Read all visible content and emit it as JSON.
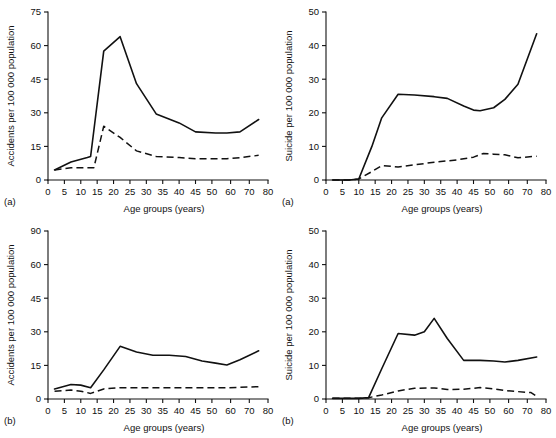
{
  "figure": {
    "background": "#ffffff",
    "ink_color": "#111111",
    "panel_count": 4
  },
  "panels": [
    {
      "id": "top-left",
      "letter": "(a)",
      "ylabel": "Accidents per 100 000 population",
      "xlabel": "Age groups (years)",
      "yticks": [
        "0",
        "15",
        "30",
        "45",
        "60",
        "75"
      ],
      "xticks": [
        "0",
        "5",
        "10",
        "15",
        "20",
        "25",
        "30",
        "35",
        "40",
        "45",
        "50",
        "60",
        "70",
        "80"
      ]
    },
    {
      "id": "top-right",
      "letter": "(a)",
      "ylabel": "Suicide per 100 000 population",
      "xlabel": "Age groups (years)",
      "yticks": [
        "0",
        "10",
        "20",
        "30",
        "40",
        "50"
      ],
      "xticks": [
        "0",
        "5",
        "10",
        "15",
        "20",
        "25",
        "30",
        "35",
        "40",
        "45",
        "50",
        "60",
        "70",
        "80"
      ]
    },
    {
      "id": "bottom-left",
      "letter": "(b)",
      "ylabel": "Accidents per 100 000 population",
      "xlabel": "Age groups (years)",
      "yticks": [
        "0",
        "15",
        "30",
        "45",
        "60",
        "90"
      ],
      "xticks": [
        "0",
        "5",
        "10",
        "15",
        "20",
        "25",
        "30",
        "35",
        "40",
        "45",
        "50",
        "60",
        "70",
        "80"
      ]
    },
    {
      "id": "bottom-right",
      "letter": "(b)",
      "ylabel": "Suicide per 100 000 population",
      "xlabel": "Age groups (years)",
      "yticks": [
        "0",
        "10",
        "20",
        "30",
        "40",
        "50"
      ],
      "xticks": [
        "0",
        "5",
        "10",
        "15",
        "20",
        "25",
        "30",
        "35",
        "40",
        "45",
        "50",
        "60",
        "70",
        "80"
      ]
    }
  ],
  "chart_data": [
    {
      "type": "line",
      "panel": "top-left",
      "panel_letter": "(a)",
      "title": "",
      "xlabel": "Age groups (years)",
      "ylabel": "Accidents per 100 000 population",
      "xlim": [
        0,
        80
      ],
      "ylim": [
        0,
        75
      ],
      "ytick_values": [
        0,
        15,
        30,
        45,
        60,
        75
      ],
      "xtick_values": [
        0,
        5,
        10,
        15,
        20,
        25,
        30,
        35,
        40,
        45,
        50,
        60,
        70,
        80
      ],
      "x_axis_note": "linear spacing 0-50, compressed spacing for 50-60-70-80",
      "grid": false,
      "legend": "none",
      "series": [
        {
          "name": "solid-line",
          "style": "solid",
          "x": [
            2,
            7,
            12,
            13,
            17,
            22,
            27,
            33,
            40,
            45,
            52,
            58,
            65,
            75
          ],
          "values": [
            4.5,
            8.0,
            10.0,
            10.5,
            57.5,
            64.0,
            43.0,
            29.5,
            25.5,
            21.5,
            21.0,
            21.0,
            21.5,
            27.0
          ]
        },
        {
          "name": "dashed-line",
          "style": "dashed",
          "x": [
            2,
            7,
            12,
            14,
            17,
            22,
            27,
            33,
            40,
            45,
            52,
            58,
            65,
            75
          ],
          "values": [
            4.5,
            5.5,
            5.5,
            5.5,
            24.0,
            19.0,
            13.0,
            10.5,
            10.0,
            9.5,
            9.5,
            9.5,
            10.0,
            11.0
          ]
        }
      ]
    },
    {
      "type": "line",
      "panel": "top-right",
      "panel_letter": "(a)",
      "title": "",
      "xlabel": "Age groups (years)",
      "ylabel": "Suicide per 100 000 population",
      "xlim": [
        0,
        80
      ],
      "ylim": [
        0,
        50
      ],
      "ytick_values": [
        0,
        10,
        20,
        30,
        40,
        50
      ],
      "xtick_values": [
        0,
        5,
        10,
        15,
        20,
        25,
        30,
        35,
        40,
        45,
        50,
        60,
        70,
        80
      ],
      "x_axis_note": "linear spacing 0-50, compressed spacing for 50-60-70-80",
      "grid": false,
      "legend": "none",
      "series": [
        {
          "name": "solid-line",
          "style": "solid",
          "x": [
            2,
            7,
            10,
            14,
            17,
            22,
            27,
            33,
            37,
            42,
            45,
            47,
            52,
            58,
            65,
            75
          ],
          "values": [
            0.0,
            0.0,
            0.3,
            10.0,
            18.5,
            25.5,
            25.3,
            24.8,
            24.3,
            22.0,
            20.8,
            20.6,
            21.5,
            24.0,
            28.5,
            43.5
          ]
        },
        {
          "name": "dashed-line",
          "style": "dashed",
          "x": [
            2,
            7,
            10,
            14,
            17,
            22,
            27,
            33,
            40,
            45,
            48,
            52,
            58,
            65,
            75
          ],
          "values": [
            0.0,
            0.0,
            0.3,
            2.5,
            4.3,
            3.9,
            4.5,
            5.3,
            6.0,
            6.8,
            7.9,
            7.7,
            7.5,
            6.6,
            7.1
          ]
        }
      ]
    },
    {
      "type": "line",
      "panel": "bottom-left",
      "panel_letter": "(b)",
      "title": "",
      "xlabel": "Age groups (years)",
      "ylabel": "Accidents per 100 000 population",
      "xlim": [
        0,
        80
      ],
      "ylim": [
        0,
        90
      ],
      "ytick_values": [
        0,
        15,
        30,
        45,
        60,
        90
      ],
      "ytick_note": "top tick printed as 90; tick spacing on plate is uniform",
      "xtick_values": [
        0,
        5,
        10,
        15,
        20,
        25,
        30,
        35,
        40,
        45,
        50,
        60,
        70,
        80
      ],
      "x_axis_note": "linear spacing 0-50, compressed spacing for 50-60-70-80",
      "grid": false,
      "legend": "none",
      "series": [
        {
          "name": "solid-line",
          "style": "solid",
          "x": [
            2,
            7,
            10,
            13,
            17,
            22,
            27,
            32,
            37,
            42,
            47,
            52,
            58,
            65,
            75
          ],
          "values": [
            4.5,
            6.5,
            6.2,
            5.0,
            13.0,
            23.5,
            21.0,
            19.5,
            19.5,
            19.0,
            17.0,
            16.0,
            15.2,
            17.5,
            21.5
          ]
        },
        {
          "name": "dashed-line",
          "style": "dashed",
          "x": [
            2,
            7,
            10,
            13,
            17,
            22,
            27,
            33,
            40,
            45,
            52,
            58,
            65,
            75
          ],
          "values": [
            3.5,
            4.0,
            3.5,
            2.5,
            4.5,
            5.0,
            5.0,
            5.0,
            5.0,
            5.0,
            5.0,
            5.0,
            5.2,
            5.5
          ]
        }
      ]
    },
    {
      "type": "line",
      "panel": "bottom-right",
      "panel_letter": "(b)",
      "title": "",
      "xlabel": "Age groups (years)",
      "ylabel": "Suicide per 100 000 population",
      "xlim": [
        0,
        80
      ],
      "ylim": [
        0,
        50
      ],
      "ytick_values": [
        0,
        10,
        20,
        30,
        40,
        50
      ],
      "xtick_values": [
        0,
        5,
        10,
        15,
        20,
        25,
        30,
        35,
        40,
        45,
        50,
        60,
        70,
        80
      ],
      "x_axis_note": "linear spacing 0-50, compressed spacing for 50-60-70-80",
      "grid": false,
      "legend": "none",
      "series": [
        {
          "name": "solid-line",
          "style": "solid",
          "x": [
            2,
            7,
            10,
            13,
            17,
            22,
            27,
            30,
            33,
            37,
            42,
            47,
            52,
            58,
            65,
            75
          ],
          "values": [
            0.2,
            0.2,
            0.2,
            0.4,
            9.0,
            19.5,
            19.0,
            20.0,
            24.0,
            18.0,
            11.5,
            11.5,
            11.3,
            11.0,
            11.5,
            12.5
          ]
        },
        {
          "name": "dashed-line",
          "style": "dashed",
          "x": [
            2,
            7,
            10,
            13,
            17,
            22,
            27,
            33,
            37,
            42,
            47,
            52,
            58,
            65,
            72,
            75
          ],
          "values": [
            0.2,
            0.2,
            0.2,
            0.4,
            1.2,
            2.4,
            3.2,
            3.3,
            2.8,
            2.9,
            3.4,
            3.0,
            2.5,
            2.2,
            1.9,
            0.8
          ]
        }
      ]
    }
  ]
}
